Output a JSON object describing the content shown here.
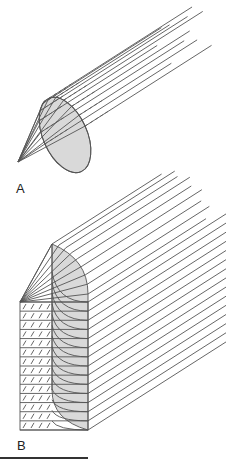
{
  "figure": {
    "panels": [
      {
        "id": "A",
        "label": "A",
        "description": "Cone of rays converging at a point, passing through an elliptical cross-section, continuing as parallel rays",
        "ray_count": 11
      },
      {
        "id": "B",
        "label": "B",
        "description": "Fan of rays from a point through a curved shaded surface into a rectangular block, continuing as parallel rays",
        "ray_count": 24,
        "row_count": 15
      }
    ],
    "colors": {
      "line": "#555555",
      "shade": "#d9d9d9",
      "background": "#ffffff"
    }
  }
}
